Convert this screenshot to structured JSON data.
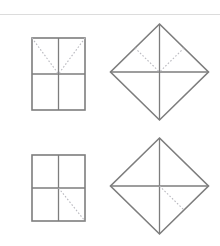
{
  "figure": {
    "background_color": "#ffffff",
    "solid_line_color": "#7d7d7d",
    "dotted_line_color": "#b9b9bf",
    "rule_color": "#dcdcdc",
    "canvas": {
      "width": 220,
      "height": 246
    }
  },
  "divider": {
    "name": "top-horizontal-rule",
    "x1": 0,
    "y1": 14.5,
    "x2": 220,
    "y2": 14.5
  },
  "panels": [
    {
      "id": "top-left-square",
      "shape": "square",
      "label": "Square with V-shaped dotted diagonals in upper half",
      "center_x": 58.5,
      "center_y": 74,
      "half_width": 26.5,
      "half_height": 36,
      "solid_lines": [
        {
          "name": "outline",
          "type": "rect"
        },
        {
          "name": "vertical-midline",
          "x1": 58.5,
          "y1": 38,
          "x2": 58.5,
          "y2": 110
        },
        {
          "name": "horizontal-midline",
          "x1": 32,
          "y1": 74,
          "x2": 85,
          "y2": 74
        }
      ],
      "dotted_lines": [
        {
          "name": "upper-left-diagonal",
          "x1": 32,
          "y1": 38,
          "x2": 58.5,
          "y2": 74
        },
        {
          "name": "upper-right-diagonal",
          "x1": 85,
          "y1": 38,
          "x2": 58.5,
          "y2": 74
        }
      ]
    },
    {
      "id": "top-right-diamond",
      "shape": "diamond",
      "label": "Diamond with V-shaped dotted diagonals in upper half",
      "center_x": 159.5,
      "center_y": 72,
      "half_width": 49,
      "half_height": 48,
      "solid_lines": [
        {
          "name": "outline",
          "type": "polygon"
        },
        {
          "name": "vertical-midline",
          "x1": 159.5,
          "y1": 24,
          "x2": 159.5,
          "y2": 120
        },
        {
          "name": "horizontal-midline",
          "x1": 110.5,
          "y1": 72,
          "x2": 208.5,
          "y2": 72
        }
      ],
      "dotted_lines": [
        {
          "name": "upper-left-diagonal",
          "x1": 135,
          "y1": 48,
          "x2": 159.5,
          "y2": 72
        },
        {
          "name": "upper-right-diagonal",
          "x1": 184,
          "y1": 48,
          "x2": 159.5,
          "y2": 72
        }
      ]
    },
    {
      "id": "bottom-left-square",
      "shape": "square",
      "label": "Square with single dotted diagonal in lower-right quadrant",
      "center_x": 58.5,
      "center_y": 188,
      "half_width": 26.5,
      "half_height": 33,
      "solid_lines": [
        {
          "name": "outline",
          "type": "rect"
        },
        {
          "name": "vertical-midline",
          "x1": 58.5,
          "y1": 155,
          "x2": 58.5,
          "y2": 221
        },
        {
          "name": "horizontal-midline",
          "x1": 32,
          "y1": 188,
          "x2": 85,
          "y2": 188
        }
      ],
      "dotted_lines": [
        {
          "name": "lower-right-diagonal",
          "x1": 58.5,
          "y1": 188,
          "x2": 85,
          "y2": 221
        }
      ]
    },
    {
      "id": "bottom-right-diamond",
      "shape": "diamond",
      "label": "Diamond with single dotted diagonal in lower-right quadrant",
      "center_x": 159.5,
      "center_y": 186,
      "half_width": 49,
      "half_height": 48,
      "solid_lines": [
        {
          "name": "outline",
          "type": "polygon"
        },
        {
          "name": "vertical-midline",
          "x1": 159.5,
          "y1": 138,
          "x2": 159.5,
          "y2": 234
        },
        {
          "name": "horizontal-midline",
          "x1": 110.5,
          "y1": 186,
          "x2": 208.5,
          "y2": 186
        }
      ],
      "dotted_lines": [
        {
          "name": "lower-right-diagonal",
          "x1": 159.5,
          "y1": 186,
          "x2": 184,
          "y2": 210
        }
      ]
    }
  ]
}
